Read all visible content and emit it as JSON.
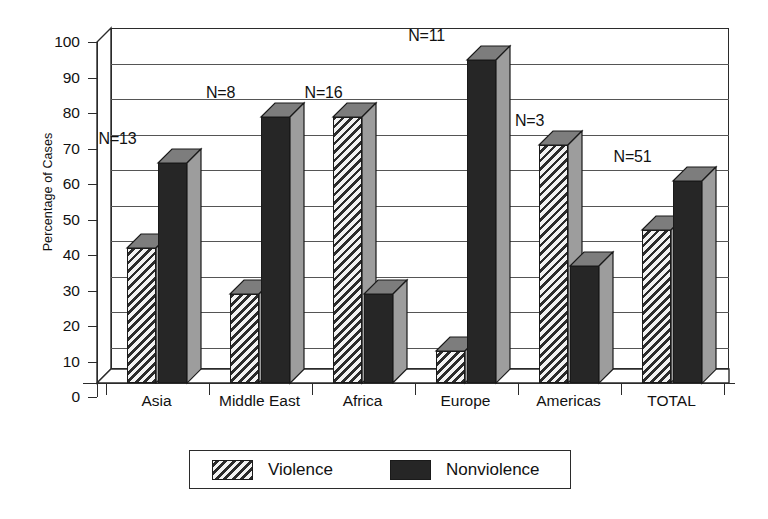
{
  "chart_data": {
    "type": "bar",
    "title": "",
    "subtitle": "",
    "xlabel": "",
    "ylabel": "Percentage of Cases",
    "ylim": [
      0,
      100
    ],
    "ytick_step": 10,
    "ytick_labels": [
      "100",
      "90",
      "80",
      "70",
      "60",
      "50",
      "40",
      "30",
      "20",
      "10",
      "0"
    ],
    "grid": true,
    "style": "3d-isometric-bar",
    "legend_position": "bottom",
    "categories": [
      "Asia",
      "Middle East",
      "Africa",
      "Europe",
      "Americas",
      "TOTAL"
    ],
    "annotations": [
      "N=13",
      "N=8",
      "N=16",
      "N=11",
      "N=3",
      "N=51"
    ],
    "series": [
      {
        "name": "Violence",
        "fill": "hatched",
        "values": [
          38,
          25,
          75,
          9,
          67,
          43
        ]
      },
      {
        "name": "Nonviolence",
        "fill": "solid",
        "values": [
          62,
          75,
          25,
          91,
          33,
          57
        ]
      }
    ]
  },
  "axes": {
    "y_title": "Percentage of Cases"
  },
  "legend": {
    "items": [
      {
        "label": "Violence",
        "swatch": "hatched-swatch"
      },
      {
        "label": "Nonviolence",
        "swatch": "solid-swatch"
      }
    ]
  },
  "colors": {
    "bar_solid": "#262626",
    "bar_hatch_dark": "#2b2b2b",
    "bar_hatch_light": "#f2f2f2",
    "bar_side": "#9d9d9d",
    "bar_top": "#7d7d7d",
    "axis": "#2b2b2b",
    "grid": "#555555",
    "background": "#ffffff"
  }
}
